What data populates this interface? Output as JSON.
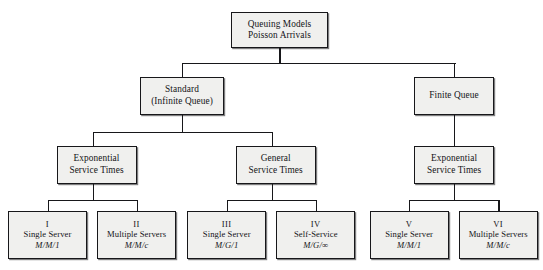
{
  "diagram": {
    "top_sliver_text": "",
    "colors": {
      "box_fill": "#f0f0ee",
      "box_border": "#17171a",
      "line": "#17171a",
      "text": "#141418",
      "page_background": "#ffffff"
    },
    "root": {
      "line1": "Queuing Models",
      "line2": "Poisson Arrivals"
    },
    "level2": [
      {
        "line1": "Standard",
        "line2": "(Infinite Queue)"
      },
      {
        "line1": "Finite Queue",
        "line2": ""
      }
    ],
    "level3": [
      {
        "line1": "Exponential",
        "line2": "Service Times"
      },
      {
        "line1": "General",
        "line2": "Service Times"
      },
      {
        "line1": "Exponential",
        "line2": "Service Times"
      }
    ],
    "leaves": [
      {
        "roman": "I",
        "name": "Single Server",
        "kendall": "M/M/1"
      },
      {
        "roman": "II",
        "name": "Multiple Servers",
        "kendall": "M/M/c"
      },
      {
        "roman": "III",
        "name": "Single Server",
        "kendall": "M/G/1"
      },
      {
        "roman": "IV",
        "name": "Self-Service",
        "kendall": "M/G/∞"
      },
      {
        "roman": "V",
        "name": "Single Server",
        "kendall": "M/M/1"
      },
      {
        "roman": "VI",
        "name": "Multiple Servers",
        "kendall": "M/M/c"
      }
    ]
  }
}
